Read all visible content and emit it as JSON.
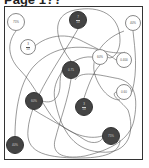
{
  "page": {
    "title": "Page 1??"
  },
  "colors": {
    "light_node_fill": "#ffffff",
    "dark_node_fill": "#444444",
    "line": "#555555",
    "frame": "#333333"
  },
  "nodes": [
    {
      "id": "n1",
      "style": "light",
      "label": "75%",
      "x": 16,
      "y": 22,
      "r": 9
    },
    {
      "id": "n2",
      "style": "dark",
      "numerator": "7",
      "denominator": "10",
      "x": 78,
      "y": 20,
      "r": 9
    },
    {
      "id": "n3",
      "style": "light",
      "label": "40%",
      "x": 133,
      "y": 23,
      "r": 8
    },
    {
      "id": "n4",
      "style": "light",
      "numerator": "3",
      "denominator": "10",
      "x": 28,
      "y": 47,
      "r": 8
    },
    {
      "id": "n5",
      "style": "light",
      "label": "60%",
      "x": 100,
      "y": 57,
      "r": 8
    },
    {
      "id": "n6",
      "style": "light",
      "label": "0.400",
      "x": 124,
      "y": 60,
      "r": 8
    },
    {
      "id": "n7",
      "style": "dark",
      "label": "0.75",
      "x": 71,
      "y": 70,
      "r": 9
    },
    {
      "id": "n8",
      "style": "light",
      "label": "0.60",
      "x": 124,
      "y": 92,
      "r": 8
    },
    {
      "id": "n9",
      "style": "dark",
      "label": "60%",
      "x": 34,
      "y": 101,
      "r": 9
    },
    {
      "id": "n10",
      "style": "dark",
      "numerator": "3",
      "denominator": "10",
      "x": 84,
      "y": 107,
      "r": 9
    },
    {
      "id": "n11",
      "style": "dark",
      "label": "75%",
      "x": 111,
      "y": 136,
      "r": 9
    },
    {
      "id": "n12",
      "style": "dark",
      "label": "40%",
      "x": 15,
      "y": 145,
      "r": 9
    }
  ]
}
